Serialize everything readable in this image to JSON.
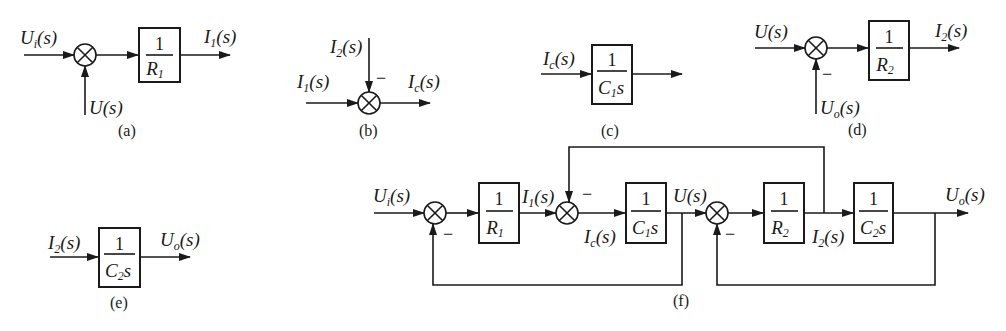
{
  "colors": {
    "stroke": "#1a1a1a",
    "background": "#ffffff"
  },
  "panels": {
    "a": {
      "caption": "(a)",
      "input_label": "U_i(s)",
      "feedback_label": "U(s)",
      "block": {
        "numerator": "1",
        "denominator": "R_1"
      },
      "output_label": "I_1(s)"
    },
    "b": {
      "caption": "(b)",
      "top_input_label": "I_2(s)",
      "top_sign": "−",
      "left_input_label": "I_1(s)",
      "output_label": "I_c(s)"
    },
    "c": {
      "caption": "(c)",
      "input_label": "I_c(s)",
      "block": {
        "numerator": "1",
        "denominator": "C_1 s"
      }
    },
    "d": {
      "caption": "(d)",
      "input_label": "U(s)",
      "feedback_label": "U_o(s)",
      "feedback_sign": "−",
      "block": {
        "numerator": "1",
        "denominator": "R_2"
      },
      "output_label": "I_2(s)"
    },
    "e": {
      "caption": "(e)",
      "input_label": "I_2(s)",
      "block": {
        "numerator": "1",
        "denominator": "C_2 s"
      },
      "output_label": "U_o(s)"
    },
    "f": {
      "caption": "(f)",
      "input_label": "U_i(s)",
      "blocks": [
        {
          "numerator": "1",
          "denominator": "R_1"
        },
        {
          "numerator": "1",
          "denominator": "C_1 s"
        },
        {
          "numerator": "1",
          "denominator": "R_2"
        },
        {
          "numerator": "1",
          "denominator": "C_2 s"
        }
      ],
      "signals": [
        "I_1(s)",
        "I_c(s)",
        "U(s)",
        "I_2(s)",
        "U_o(s)"
      ],
      "signs": [
        "−",
        "−",
        "−"
      ]
    }
  }
}
